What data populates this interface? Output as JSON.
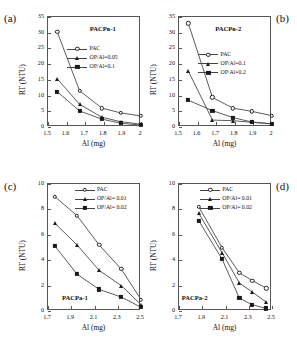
{
  "figure": {
    "panel_letters": [
      "(a)",
      "(b)",
      "(c)",
      "(d)"
    ]
  },
  "chart_data": [
    {
      "type": "line",
      "panel": "(a)",
      "title": "PACPв-1",
      "xlabel": "Al (mg)",
      "ylabel": "RT (NTU)",
      "xlim": [
        1.5,
        2.0
      ],
      "ylim": [
        0,
        35
      ],
      "xticks": [
        "1.5",
        "1.6",
        "1.7",
        "1.8",
        "1.9",
        "2"
      ],
      "yticks": [
        "0",
        "5",
        "10",
        "15",
        "20",
        "25",
        "30",
        "35"
      ],
      "grid": false,
      "legend_position": "upper-right-inside",
      "series": [
        {
          "name": "PAC",
          "marker": "open-circle",
          "x": [
            1.55,
            1.67,
            1.79,
            1.89,
            2.0
          ],
          "values": [
            30.2,
            11.5,
            6.0,
            4.5,
            3.5
          ]
        },
        {
          "name": "OP/Al=0.05",
          "marker": "filled-triangle",
          "x": [
            1.55,
            1.67,
            1.79,
            1.89,
            2.0
          ],
          "values": [
            15.3,
            7.2,
            3.1,
            1.7,
            0.9
          ]
        },
        {
          "name": "OP/Al=0.1",
          "marker": "filled-square",
          "x": [
            1.55,
            1.67,
            1.79,
            1.89,
            2.0
          ],
          "values": [
            11.2,
            5.1,
            2.5,
            1.2,
            0.6
          ]
        }
      ]
    },
    {
      "type": "line",
      "panel": "(b)",
      "title": "PACPв-2",
      "xlabel": "Al (mg)",
      "ylabel": "RT (NTU)",
      "xlim": [
        1.5,
        2.0
      ],
      "ylim": [
        0,
        35
      ],
      "xticks": [
        "1.5",
        "1.6",
        "1.7",
        "1.8",
        "1.9",
        "2"
      ],
      "yticks": [
        "0",
        "5",
        "10",
        "15",
        "20",
        "25",
        "30",
        "35"
      ],
      "grid": false,
      "legend_position": "upper-right-inside",
      "series": [
        {
          "name": "PAC",
          "marker": "open-circle",
          "x": [
            1.55,
            1.68,
            1.79,
            1.89,
            2.0
          ],
          "values": [
            33.0,
            9.4,
            6.0,
            5.0,
            3.6
          ]
        },
        {
          "name": "OP/Al=0.1",
          "marker": "filled-triangle",
          "x": [
            1.55,
            1.68,
            1.79,
            1.89,
            2.0
          ],
          "values": [
            17.8,
            2.2,
            2.0,
            1.5,
            1.0
          ]
        },
        {
          "name": "OP/Al=0.2",
          "marker": "filled-square",
          "x": [
            1.55,
            1.68,
            1.79,
            1.89,
            2.0
          ],
          "values": [
            8.5,
            5.2,
            3.0,
            1.6,
            1.0
          ]
        }
      ]
    },
    {
      "type": "line",
      "panel": "(c)",
      "title": "PACPa-1",
      "xlabel": "Al (mg)",
      "ylabel": "RT (NTU)",
      "xlim": [
        1.7,
        2.5
      ],
      "ylim": [
        0,
        10
      ],
      "xticks": [
        "1.7",
        "1.9",
        "2.1",
        "2.3",
        "2.5"
      ],
      "yticks": [
        "0",
        "2",
        "4",
        "6",
        "8",
        "10"
      ],
      "grid": false,
      "legend_position": "upper-right-inside",
      "series": [
        {
          "name": "PAC",
          "marker": "open-circle",
          "x": [
            1.76,
            1.95,
            2.14,
            2.33,
            2.5
          ],
          "values": [
            9.0,
            7.5,
            5.2,
            3.3,
            0.9
          ]
        },
        {
          "name": "OP/Al= 0.01",
          "marker": "filled-triangle",
          "x": [
            1.76,
            1.95,
            2.14,
            2.33,
            2.5
          ],
          "values": [
            6.9,
            5.2,
            3.2,
            2.0,
            0.5
          ]
        },
        {
          "name": "OP/Al= 0.02",
          "marker": "filled-square",
          "x": [
            1.76,
            1.95,
            2.14,
            2.33,
            2.5
          ],
          "values": [
            5.1,
            2.9,
            1.7,
            1.1,
            0.3
          ]
        }
      ]
    },
    {
      "type": "line",
      "panel": "(d)",
      "title": "PACPa-2",
      "xlabel": "Al (mg)",
      "ylabel": "RT (NTU)",
      "xlim": [
        1.7,
        2.5
      ],
      "ylim": [
        0,
        10
      ],
      "xticks": [
        "1.7",
        "1.9",
        "2.1",
        "2.3",
        "2.5"
      ],
      "yticks": [
        "0",
        "2",
        "4",
        "6",
        "8",
        "10"
      ],
      "grid": false,
      "legend_position": "upper-right-inside",
      "series": [
        {
          "name": "PAC",
          "marker": "open-circle",
          "x": [
            1.87,
            2.07,
            2.22,
            2.33,
            2.45
          ],
          "values": [
            8.2,
            5.0,
            3.0,
            2.4,
            1.8
          ]
        },
        {
          "name": "OP/Al= 0.01",
          "marker": "filled-triangle",
          "x": [
            1.87,
            2.07,
            2.22,
            2.33,
            2.45
          ],
          "values": [
            7.7,
            4.6,
            2.2,
            1.5,
            0.7
          ]
        },
        {
          "name": "OP/Al= 0.02",
          "marker": "filled-square",
          "x": [
            1.87,
            2.07,
            2.22,
            2.33,
            2.45
          ],
          "values": [
            7.1,
            4.1,
            1.0,
            0.5,
            0.2
          ]
        }
      ]
    }
  ]
}
